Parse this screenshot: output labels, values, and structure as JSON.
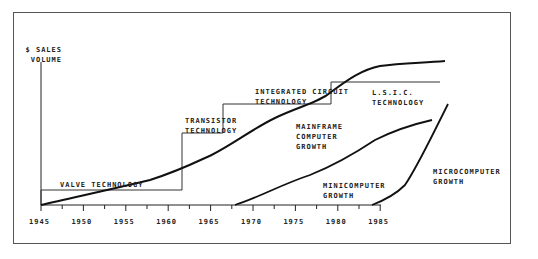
{
  "chart_data": {
    "type": "line",
    "title": "",
    "xlabel": "",
    "ylabel": "$ SALES VOLUME",
    "x_ticks": [
      "1945",
      "1950",
      "1955",
      "1960",
      "1965",
      "1970",
      "1975",
      "1980",
      "1985"
    ],
    "xlim": [
      1945,
      1985
    ],
    "grid": false,
    "legend": "none (inline annotations)",
    "technology_eras": [
      {
        "label": "VALVE TECHNOLOGY",
        "start": 1945,
        "end": 1958,
        "level": 1
      },
      {
        "label": "TRANSISTOR TECHNOLOGY",
        "start": 1958,
        "end": 1964,
        "level": 2
      },
      {
        "label": "INTEGRATED CIRCUIT TECHNOLOGY",
        "start": 1964,
        "end": 1972,
        "level": 3
      },
      {
        "label": "L.S.I.C. TECHNOLOGY",
        "start": 1972,
        "end": 1982,
        "level": 4
      }
    ],
    "series": [
      {
        "name": "MAINFRAME COMPUTER GROWTH",
        "x": [
          1945,
          1950,
          1955,
          1958,
          1960,
          1963,
          1966,
          1970,
          1972,
          1975,
          1980,
          1983
        ],
        "values": [
          0,
          10,
          22,
          30,
          40,
          58,
          75,
          92,
          100,
          120,
          126,
          128
        ]
      },
      {
        "name": "MINICOMPUTER GROWTH",
        "x": [
          1963,
          1965,
          1970,
          1975,
          1980,
          1983
        ],
        "values": [
          0,
          12,
          35,
          62,
          78,
          80
        ]
      },
      {
        "name": "MICROCOMPUTER GROWTH",
        "x": [
          1975,
          1978,
          1980,
          1982,
          1983
        ],
        "values": [
          0,
          15,
          35,
          65,
          85
        ]
      }
    ]
  },
  "labels": {
    "y_axis": [
      "$ SALES",
      "VOLUME"
    ],
    "valve": "VALVE TECHNOLOGY",
    "transistor": [
      "TRANSISTOR",
      "TECHNOLOGY"
    ],
    "ic": [
      "INTEGRATED CIRCUIT",
      "TECHNOLOGY"
    ],
    "lsic": [
      "L.S.I.C.",
      "TECHNOLOGY"
    ],
    "mainframe": [
      "MAINFRAME",
      "COMPUTER",
      "GROWTH"
    ],
    "mini": [
      "MINICOMPUTER",
      "GROWTH"
    ],
    "micro": [
      "MICROCOMPUTER",
      "GROWTH"
    ]
  }
}
